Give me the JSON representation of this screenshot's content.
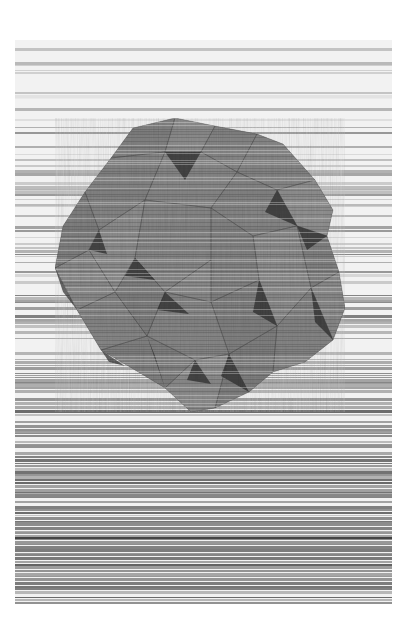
{
  "canvas": {
    "width": 412,
    "height": 636,
    "background": "#ffffff"
  },
  "artwork": {
    "x": 15,
    "y": 40,
    "width": 377,
    "height": 564,
    "subject": "faceted-polyhedron-over-horizontal-scanlines",
    "palette": {
      "light": "#f2f2f2",
      "mid": "#8a8a8a",
      "dark": "#2e2e2e",
      "facet_base": "#7d7d7d"
    },
    "stripes": {
      "seed": 7,
      "count": 190,
      "density_top": 0.35,
      "density_bottom": 0.95
    },
    "polyhedron": {
      "outline": [
        [
          118,
          88
        ],
        [
          160,
          78
        ],
        [
          200,
          86
        ],
        [
          242,
          94
        ],
        [
          268,
          104
        ],
        [
          300,
          140
        ],
        [
          318,
          170
        ],
        [
          312,
          196
        ],
        [
          324,
          232
        ],
        [
          330,
          268
        ],
        [
          318,
          300
        ],
        [
          290,
          322
        ],
        [
          258,
          332
        ],
        [
          234,
          352
        ],
        [
          200,
          368
        ],
        [
          176,
          372
        ],
        [
          150,
          348
        ],
        [
          120,
          330
        ],
        [
          86,
          310
        ],
        [
          62,
          270
        ],
        [
          40,
          228
        ],
        [
          48,
          186
        ],
        [
          70,
          152
        ],
        [
          96,
          118
        ]
      ],
      "facets": [
        {
          "points": [
            [
              118,
              88
            ],
            [
              160,
              78
            ],
            [
              150,
              112
            ],
            [
              96,
              118
            ]
          ],
          "shade": 0.55
        },
        {
          "points": [
            [
              160,
              78
            ],
            [
              200,
              86
            ],
            [
              186,
              112
            ],
            [
              150,
              112
            ]
          ],
          "shade": 0.35
        },
        {
          "points": [
            [
              200,
              86
            ],
            [
              242,
              94
            ],
            [
              222,
              132
            ],
            [
              186,
              112
            ]
          ],
          "shade": 0.5
        },
        {
          "points": [
            [
              242,
              94
            ],
            [
              268,
              104
            ],
            [
              300,
              140
            ],
            [
              262,
              150
            ],
            [
              222,
              132
            ]
          ],
          "shade": 0.45
        },
        {
          "points": [
            [
              300,
              140
            ],
            [
              318,
              170
            ],
            [
              312,
              196
            ],
            [
              282,
              186
            ],
            [
              262,
              150
            ]
          ],
          "shade": 0.3
        },
        {
          "points": [
            [
              312,
              196
            ],
            [
              324,
              232
            ],
            [
              296,
              248
            ],
            [
              282,
              186
            ]
          ],
          "shade": 0.55
        },
        {
          "points": [
            [
              324,
              232
            ],
            [
              330,
              268
            ],
            [
              318,
              300
            ],
            [
              296,
              248
            ]
          ],
          "shade": 0.4
        },
        {
          "points": [
            [
              318,
              300
            ],
            [
              290,
              322
            ],
            [
              258,
              332
            ],
            [
              262,
              286
            ],
            [
              296,
              248
            ]
          ],
          "shade": 0.5
        },
        {
          "points": [
            [
              258,
              332
            ],
            [
              234,
              352
            ],
            [
              200,
              368
            ],
            [
              214,
              314
            ],
            [
              262,
              286
            ]
          ],
          "shade": 0.6
        },
        {
          "points": [
            [
              200,
              368
            ],
            [
              176,
              372
            ],
            [
              150,
              348
            ],
            [
              180,
              320
            ],
            [
              214,
              314
            ]
          ],
          "shade": 0.35
        },
        {
          "points": [
            [
              150,
              348
            ],
            [
              120,
              330
            ],
            [
              86,
              310
            ],
            [
              132,
              296
            ],
            [
              180,
              320
            ]
          ],
          "shade": 0.55
        },
        {
          "points": [
            [
              86,
              310
            ],
            [
              62,
              270
            ],
            [
              100,
              252
            ],
            [
              132,
              296
            ]
          ],
          "shade": 0.45
        },
        {
          "points": [
            [
              62,
              270
            ],
            [
              40,
              228
            ],
            [
              74,
              210
            ],
            [
              100,
              252
            ]
          ],
          "shade": 0.4
        },
        {
          "points": [
            [
              40,
              228
            ],
            [
              48,
              186
            ],
            [
              70,
              152
            ],
            [
              84,
              190
            ],
            [
              74,
              210
            ]
          ],
          "shade": 0.6
        },
        {
          "points": [
            [
              70,
              152
            ],
            [
              96,
              118
            ],
            [
              150,
              112
            ],
            [
              130,
              160
            ],
            [
              84,
              190
            ]
          ],
          "shade": 0.5
        },
        {
          "points": [
            [
              150,
              112
            ],
            [
              186,
              112
            ],
            [
              222,
              132
            ],
            [
              196,
              168
            ],
            [
              130,
              160
            ]
          ],
          "shade": 0.42
        },
        {
          "points": [
            [
              222,
              132
            ],
            [
              262,
              150
            ],
            [
              282,
              186
            ],
            [
              238,
              196
            ],
            [
              196,
              168
            ]
          ],
          "shade": 0.5
        },
        {
          "points": [
            [
              282,
              186
            ],
            [
              296,
              248
            ],
            [
              262,
              286
            ],
            [
              244,
              240
            ],
            [
              238,
              196
            ]
          ],
          "shade": 0.38
        },
        {
          "points": [
            [
              244,
              240
            ],
            [
              262,
              286
            ],
            [
              214,
              314
            ],
            [
              196,
              262
            ]
          ],
          "shade": 0.55
        },
        {
          "points": [
            [
              196,
              262
            ],
            [
              214,
              314
            ],
            [
              180,
              320
            ],
            [
              132,
              296
            ],
            [
              150,
              252
            ]
          ],
          "shade": 0.45
        },
        {
          "points": [
            [
              150,
              252
            ],
            [
              132,
              296
            ],
            [
              100,
              252
            ],
            [
              120,
              218
            ]
          ],
          "shade": 0.6
        },
        {
          "points": [
            [
              120,
              218
            ],
            [
              100,
              252
            ],
            [
              74,
              210
            ],
            [
              84,
              190
            ],
            [
              130,
              160
            ]
          ],
          "shade": 0.35
        },
        {
          "points": [
            [
              130,
              160
            ],
            [
              196,
              168
            ],
            [
              196,
              220
            ],
            [
              150,
              252
            ],
            [
              120,
              218
            ]
          ],
          "shade": 0.48
        },
        {
          "points": [
            [
              196,
              168
            ],
            [
              238,
              196
            ],
            [
              244,
              240
            ],
            [
              196,
              262
            ],
            [
              196,
              220
            ]
          ],
          "shade": 0.52
        },
        {
          "points": [
            [
              196,
              220
            ],
            [
              196,
              262
            ],
            [
              150,
              252
            ]
          ],
          "shade": 0.4
        }
      ],
      "dark_wedges": [
        [
          [
            150,
            112
          ],
          [
            186,
            112
          ],
          [
            170,
            140
          ]
        ],
        [
          [
            262,
            150
          ],
          [
            282,
            186
          ],
          [
            250,
            172
          ]
        ],
        [
          [
            282,
            186
          ],
          [
            312,
            196
          ],
          [
            292,
            210
          ]
        ],
        [
          [
            84,
            190
          ],
          [
            74,
            210
          ],
          [
            92,
            214
          ]
        ],
        [
          [
            120,
            218
          ],
          [
            140,
            240
          ],
          [
            110,
            236
          ]
        ],
        [
          [
            150,
            252
          ],
          [
            174,
            274
          ],
          [
            142,
            270
          ]
        ],
        [
          [
            244,
            240
          ],
          [
            262,
            286
          ],
          [
            238,
            272
          ]
        ],
        [
          [
            296,
            248
          ],
          [
            318,
            300
          ],
          [
            300,
            282
          ]
        ],
        [
          [
            214,
            314
          ],
          [
            234,
            352
          ],
          [
            206,
            336
          ]
        ],
        [
          [
            132,
            296
          ],
          [
            150,
            348
          ],
          [
            140,
            316
          ]
        ],
        [
          [
            86,
            310
          ],
          [
            110,
            326
          ],
          [
            94,
            322
          ]
        ],
        [
          [
            180,
            320
          ],
          [
            196,
            344
          ],
          [
            172,
            340
          ]
        ],
        [
          [
            40,
            228
          ],
          [
            62,
            270
          ],
          [
            48,
            252
          ]
        ]
      ]
    }
  }
}
